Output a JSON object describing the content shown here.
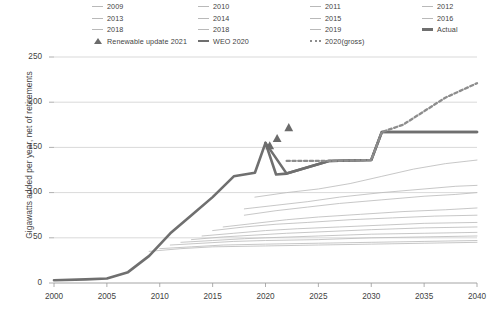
{
  "chart_data": {
    "type": "line",
    "title": "",
    "xlabel": "",
    "ylabel": "Gigawatts added per year, net of retirements",
    "xlim": [
      2000,
      2040
    ],
    "ylim": [
      0,
      250
    ],
    "xticks": [
      2000,
      2005,
      2010,
      2015,
      2020,
      2025,
      2030,
      2035,
      2040
    ],
    "yticks": [
      0,
      50,
      100,
      150,
      200,
      250
    ],
    "grid": "horizontal",
    "legend_position": "top",
    "series": [
      {
        "name": "2009",
        "style": "thin-gray",
        "x": [
          2009,
          2012,
          2015,
          2020,
          2025,
          2030,
          2035,
          2040
        ],
        "values": [
          35,
          38,
          40,
          41,
          42,
          43,
          44,
          45
        ]
      },
      {
        "name": "2010",
        "style": "thin-gray",
        "x": [
          2010,
          2013,
          2016,
          2020,
          2025,
          2030,
          2035,
          2040
        ],
        "values": [
          38,
          40,
          42,
          43,
          44,
          45,
          46,
          47
        ]
      },
      {
        "name": "2011",
        "style": "thin-gray",
        "x": [
          2011,
          2014,
          2017,
          2020,
          2025,
          2030,
          2035,
          2040
        ],
        "values": [
          42,
          44,
          46,
          47,
          48,
          50,
          51,
          52
        ]
      },
      {
        "name": "2012",
        "style": "thin-gray",
        "x": [
          2012,
          2015,
          2018,
          2020,
          2025,
          2030,
          2035,
          2040
        ],
        "values": [
          45,
          47,
          49,
          50,
          52,
          54,
          55,
          56
        ]
      },
      {
        "name": "2013",
        "style": "thin-gray",
        "x": [
          2013,
          2016,
          2019,
          2022,
          2026,
          2030,
          2035,
          2040
        ],
        "values": [
          48,
          51,
          53,
          55,
          57,
          59,
          61,
          62
        ]
      },
      {
        "name": "2014",
        "style": "thin-gray",
        "x": [
          2014,
          2017,
          2020,
          2023,
          2027,
          2031,
          2035,
          2040
        ],
        "values": [
          52,
          55,
          58,
          60,
          62,
          64,
          66,
          67
        ]
      },
      {
        "name": "2015",
        "style": "thin-gray",
        "x": [
          2015,
          2018,
          2021,
          2024,
          2028,
          2032,
          2036,
          2040
        ],
        "values": [
          58,
          62,
          65,
          67,
          70,
          72,
          74,
          75
        ]
      },
      {
        "name": "2016",
        "style": "thin-gray",
        "x": [
          2016,
          2019,
          2022,
          2025,
          2029,
          2033,
          2037,
          2040
        ],
        "values": [
          62,
          66,
          70,
          73,
          76,
          79,
          81,
          83
        ]
      },
      {
        "name": "2018",
        "style": "thin-gray",
        "x": [
          2018,
          2021,
          2024,
          2027,
          2031,
          2035,
          2038,
          2040
        ],
        "values": [
          75,
          80,
          84,
          88,
          92,
          96,
          98,
          100
        ]
      },
      {
        "name": "2018",
        "style": "thin-gray",
        "x": [
          2018,
          2021,
          2024,
          2027,
          2031,
          2035,
          2038,
          2040
        ],
        "values": [
          82,
          86,
          90,
          95,
          100,
          104,
          107,
          108
        ]
      },
      {
        "name": "2019",
        "style": "thin-gray",
        "x": [
          2019,
          2022,
          2025,
          2028,
          2031,
          2034,
          2037,
          2040
        ],
        "values": [
          95,
          100,
          104,
          110,
          118,
          126,
          132,
          136
        ]
      },
      {
        "name": "Actual",
        "style": "thick-gray",
        "x": [
          2000,
          2003,
          2005,
          2007,
          2009,
          2011,
          2013,
          2015,
          2017,
          2018,
          2019,
          2020,
          2021,
          2022,
          2026,
          2030,
          2031,
          2040
        ],
        "values": [
          3,
          4,
          5,
          12,
          30,
          55,
          75,
          95,
          118,
          120,
          122,
          155,
          120,
          121,
          135,
          136,
          167,
          167
        ]
      },
      {
        "name": "WEO 2020",
        "style": "thick-gray",
        "x": [
          2020,
          2022,
          2026,
          2030,
          2031,
          2040
        ],
        "values": [
          155,
          121,
          135,
          136,
          167,
          167
        ]
      },
      {
        "name": "2020(gross)",
        "style": "dotted-gray",
        "x": [
          2022,
          2026,
          2030,
          2031,
          2033,
          2035,
          2037,
          2040
        ],
        "values": [
          135,
          135,
          136,
          167,
          175,
          190,
          205,
          221
        ]
      }
    ],
    "markers": [
      {
        "name": "Renewable update 2021",
        "x": 2020.4,
        "y": 152
      },
      {
        "name": "Renewable update 2021",
        "x": 2021.1,
        "y": 160
      },
      {
        "name": "Renewable update 2021",
        "x": 2022.2,
        "y": 172
      }
    ]
  },
  "legend": {
    "columns": [
      {
        "items": [
          {
            "label": "2009",
            "style": "thin"
          },
          {
            "label": "2013",
            "style": "thin"
          },
          {
            "label": "2018",
            "style": "thin"
          },
          {
            "label": "Renewable update 2021",
            "style": "triangle"
          }
        ]
      },
      {
        "items": [
          {
            "label": "2010",
            "style": "thin"
          },
          {
            "label": "2014",
            "style": "thin"
          },
          {
            "label": "2018",
            "style": "thin"
          },
          {
            "label": "WEO 2020",
            "style": "thick"
          }
        ]
      },
      {
        "items": [
          {
            "label": "2011",
            "style": "thin"
          },
          {
            "label": "2015",
            "style": "thin"
          },
          {
            "label": "2019",
            "style": "thin"
          },
          {
            "label": "2020(gross)",
            "style": "dashed"
          }
        ]
      },
      {
        "items": [
          {
            "label": "2012",
            "style": "thin"
          },
          {
            "label": "2016",
            "style": "thin"
          },
          {
            "label": "Actual",
            "style": "thick"
          }
        ]
      }
    ]
  },
  "colors": {
    "thin_line": "#bdbdbd",
    "thick_line": "#6f6f6f",
    "dotted_line": "#8d8d8d",
    "grid": "#cfcfcf",
    "axis": "#9a9a9a",
    "text": "#3f3f3f",
    "marker": "#6b6b6b"
  }
}
